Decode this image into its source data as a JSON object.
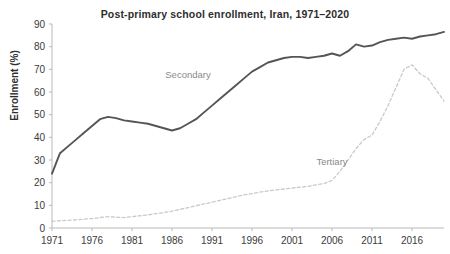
{
  "chart_data": {
    "type": "line",
    "title": "Post-primary school enrollment, Iran, 1971–2020",
    "xlabel": "",
    "ylabel": "Enrollment (%)",
    "xlim": [
      1971,
      2020
    ],
    "ylim": [
      0,
      90
    ],
    "ytick_step": 10,
    "yticks": [
      0,
      10,
      20,
      30,
      40,
      50,
      60,
      70,
      80,
      90
    ],
    "xticks": [
      1971,
      1976,
      1981,
      1986,
      1991,
      1996,
      2001,
      2006,
      2011,
      2016
    ],
    "grid": false,
    "legend_position": "inline-annotation",
    "x": [
      1971,
      1972,
      1973,
      1974,
      1975,
      1976,
      1977,
      1978,
      1979,
      1980,
      1981,
      1982,
      1983,
      1984,
      1985,
      1986,
      1987,
      1988,
      1989,
      1990,
      1991,
      1992,
      1993,
      1994,
      1995,
      1996,
      1997,
      1998,
      1999,
      2000,
      2001,
      2002,
      2003,
      2004,
      2005,
      2006,
      2007,
      2008,
      2009,
      2010,
      2011,
      2012,
      2013,
      2014,
      2015,
      2016,
      2017,
      2018,
      2019,
      2020
    ],
    "series": [
      {
        "name": "Secondary",
        "style": "solid",
        "color": "#555555",
        "label_x": 1988,
        "label_y": 66,
        "values": [
          24,
          33,
          36,
          39,
          42,
          45,
          48,
          49,
          48.5,
          47.5,
          47,
          46.5,
          46,
          45,
          44,
          43,
          44,
          46,
          48,
          51,
          54,
          57,
          60,
          63,
          66,
          69,
          71,
          73,
          74,
          75,
          75.5,
          75.5,
          75,
          75.5,
          76,
          77,
          76,
          78,
          81,
          80,
          80.5,
          82,
          83,
          83.5,
          84,
          83.5,
          84.5,
          85,
          85.5,
          86.5
        ]
      },
      {
        "name": "Tertiary",
        "style": "dashed",
        "color": "#c9c9c9",
        "label_x": 2006,
        "label_y": 28,
        "values": [
          3,
          3.2,
          3.4,
          3.6,
          3.9,
          4.2,
          4.6,
          5,
          4.8,
          4.6,
          5,
          5.4,
          5.8,
          6.3,
          6.8,
          7.4,
          8.2,
          9,
          9.8,
          10.6,
          11.4,
          12.2,
          13,
          13.8,
          14.6,
          15.2,
          15.8,
          16.4,
          16.8,
          17.2,
          17.6,
          18,
          18.4,
          19,
          19.6,
          21,
          25,
          30,
          35,
          39,
          41,
          47,
          54,
          62,
          70,
          72,
          68,
          66,
          61,
          56
        ]
      }
    ]
  }
}
